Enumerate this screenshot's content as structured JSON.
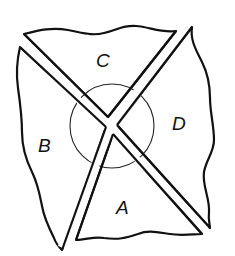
{
  "diagram": {
    "regions": [
      {
        "id": "A",
        "label": "A",
        "position": "bottom"
      },
      {
        "id": "B",
        "label": "B",
        "position": "left"
      },
      {
        "id": "C",
        "label": "C",
        "position": "top"
      },
      {
        "id": "D",
        "label": "D",
        "position": "right"
      }
    ],
    "center_circle": {
      "cx": 112,
      "cy": 126,
      "r": 42
    },
    "colors": {
      "stroke": "#111111",
      "fill": "#ffffff"
    }
  }
}
